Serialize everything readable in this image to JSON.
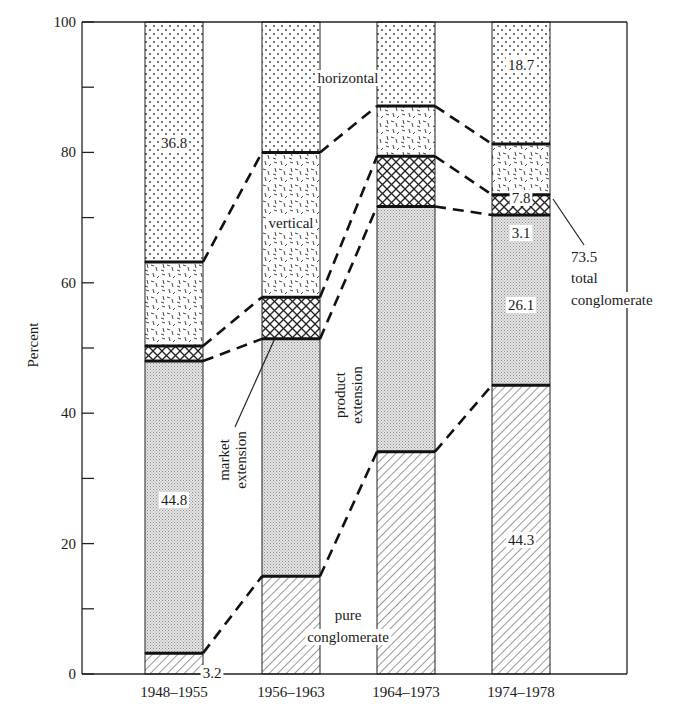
{
  "chart_data": {
    "type": "bar",
    "stacked": true,
    "title": "",
    "xlabel": "",
    "ylabel": "Percent",
    "ylim": [
      0,
      100
    ],
    "yticks": [
      0,
      20,
      40,
      60,
      80,
      100
    ],
    "yminor_ticks": [
      10,
      30,
      50,
      70,
      90
    ],
    "grid": false,
    "legend": "none (series labelled inline)",
    "categories": [
      "1948–1955",
      "1956–1963",
      "1964–1973",
      "1974–1978"
    ],
    "series": [
      {
        "name": "pure conglomerate",
        "pattern": "diagonal-hatch",
        "values": [
          3.2,
          15.0,
          34.1,
          44.3
        ]
      },
      {
        "name": "product extension",
        "pattern": "fine-dots",
        "values": [
          44.8,
          36.4,
          37.6,
          26.1
        ]
      },
      {
        "name": "market extension",
        "pattern": "crosshatch",
        "values": [
          2.3,
          6.4,
          7.7,
          3.1
        ]
      },
      {
        "name": "vertical",
        "pattern": "dashes",
        "values": [
          12.9,
          22.2,
          7.7,
          7.8
        ]
      },
      {
        "name": "horizontal",
        "pattern": "sparse-dots",
        "values": [
          36.8,
          20.0,
          12.9,
          18.7
        ]
      }
    ],
    "data_labels": [
      {
        "category": "1948–1955",
        "series": "horizontal",
        "text": "36.8"
      },
      {
        "category": "1948–1955",
        "series": "product extension",
        "text": "44.8"
      },
      {
        "category": "1948–1955",
        "series": "pure conglomerate",
        "text": "3.2"
      },
      {
        "category": "1974–1978",
        "series": "horizontal",
        "text": "18.7"
      },
      {
        "category": "1974–1978",
        "series": "vertical",
        "text": "7.8"
      },
      {
        "category": "1974–1978",
        "series": "market extension",
        "text": "3.1"
      },
      {
        "category": "1974–1978",
        "series": "product extension",
        "text": "26.1"
      },
      {
        "category": "1974–1978",
        "series": "pure conglomerate",
        "text": "44.3"
      }
    ],
    "annotations": [
      {
        "text": "horizontal"
      },
      {
        "text": "vertical"
      },
      {
        "text": "market extension"
      },
      {
        "text": "product extension"
      },
      {
        "text": "pure conglomerate"
      },
      {
        "text": "73.5 total conglomerate"
      }
    ]
  },
  "labels": {
    "ylabel": "Percent",
    "ticks": [
      "0",
      "20",
      "40",
      "60",
      "80",
      "100"
    ],
    "categories": [
      "1948–1955",
      "1956–1963",
      "1964–1973",
      "1974–1978"
    ],
    "horizontal": "horizontal",
    "vertical": "vertical",
    "market": [
      "market",
      "extension"
    ],
    "product": [
      "product",
      "extension"
    ],
    "pure": [
      "pure",
      "conglomerate"
    ],
    "total": [
      "73.5",
      "total",
      "conglomerate"
    ]
  }
}
